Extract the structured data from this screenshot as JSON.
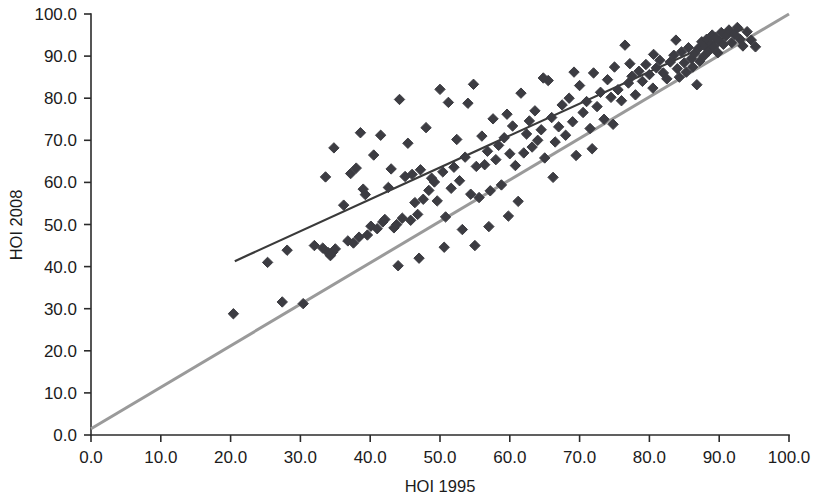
{
  "chart_data": {
    "type": "scatter",
    "title": "",
    "xlabel": "HOI 1995",
    "ylabel": "HOI 2008",
    "xlim": [
      0,
      100
    ],
    "ylim": [
      0,
      100
    ],
    "grid": false,
    "legend": null,
    "xticks": [
      "0.0",
      "10.0",
      "20.0",
      "30.0",
      "40.0",
      "50.0",
      "60.0",
      "70.0",
      "80.0",
      "90.0",
      "100.0"
    ],
    "yticks": [
      "0.0",
      "10.0",
      "20.0",
      "30.0",
      "40.0",
      "50.0",
      "60.0",
      "70.0",
      "80.0",
      "90.0",
      "100.0"
    ],
    "xtick_values": [
      0,
      10,
      20,
      30,
      40,
      50,
      60,
      70,
      80,
      90,
      100
    ],
    "ytick_values": [
      0,
      10,
      20,
      30,
      40,
      50,
      60,
      70,
      80,
      90,
      100
    ],
    "marker": "diamond",
    "marker_color": "#3c3c42",
    "marker_size": 7.2,
    "series": [
      {
        "name": "countries",
        "points": [
          [
            20.4,
            28.8
          ],
          [
            25.3,
            41.0
          ],
          [
            27.4,
            31.6
          ],
          [
            28.1,
            43.9
          ],
          [
            30.4,
            31.2
          ],
          [
            32.0,
            45.0
          ],
          [
            33.2,
            44.4
          ],
          [
            33.6,
            61.3
          ],
          [
            34.0,
            43.3
          ],
          [
            34.3,
            42.6
          ],
          [
            34.6,
            43.4
          ],
          [
            35.0,
            44.2
          ],
          [
            34.8,
            68.2
          ],
          [
            36.2,
            54.6
          ],
          [
            36.8,
            46.1
          ],
          [
            37.2,
            62.1
          ],
          [
            37.6,
            45.6
          ],
          [
            38.0,
            63.4
          ],
          [
            38.4,
            47.0
          ],
          [
            38.6,
            71.8
          ],
          [
            39.0,
            58.4
          ],
          [
            39.3,
            57.1
          ],
          [
            39.6,
            47.5
          ],
          [
            40.1,
            49.6
          ],
          [
            40.5,
            66.5
          ],
          [
            41.0,
            49.0
          ],
          [
            41.5,
            71.2
          ],
          [
            41.8,
            50.6
          ],
          [
            42.1,
            51.2
          ],
          [
            42.6,
            58.8
          ],
          [
            43.0,
            63.2
          ],
          [
            43.4,
            49.2
          ],
          [
            43.8,
            50.0
          ],
          [
            44.2,
            79.7
          ],
          [
            44.6,
            51.5
          ],
          [
            45.0,
            61.4
          ],
          [
            45.4,
            69.3
          ],
          [
            45.8,
            51.0
          ],
          [
            46.0,
            61.9
          ],
          [
            46.4,
            55.2
          ],
          [
            46.8,
            52.4
          ],
          [
            47.2,
            63.0
          ],
          [
            47.6,
            56.0
          ],
          [
            48.0,
            73.0
          ],
          [
            48.4,
            58.1
          ],
          [
            48.8,
            61.0
          ],
          [
            49.2,
            60.1
          ],
          [
            49.6,
            55.6
          ],
          [
            50.0,
            82.1
          ],
          [
            50.4,
            62.5
          ],
          [
            50.8,
            51.8
          ],
          [
            51.2,
            79.0
          ],
          [
            51.6,
            58.6
          ],
          [
            52.0,
            63.6
          ],
          [
            52.4,
            70.2
          ],
          [
            52.8,
            60.4
          ],
          [
            53.2,
            48.8
          ],
          [
            53.6,
            66.0
          ],
          [
            54.0,
            78.8
          ],
          [
            54.4,
            57.2
          ],
          [
            54.8,
            83.3
          ],
          [
            55.2,
            63.8
          ],
          [
            55.6,
            56.4
          ],
          [
            56.0,
            71.0
          ],
          [
            56.4,
            64.2
          ],
          [
            56.8,
            67.4
          ],
          [
            57.2,
            58.0
          ],
          [
            57.6,
            75.1
          ],
          [
            58.0,
            65.4
          ],
          [
            58.4,
            68.8
          ],
          [
            58.8,
            59.4
          ],
          [
            59.2,
            70.6
          ],
          [
            59.6,
            76.2
          ],
          [
            60.0,
            66.8
          ],
          [
            60.4,
            73.4
          ],
          [
            60.8,
            64.0
          ],
          [
            61.2,
            55.5
          ],
          [
            61.6,
            81.2
          ],
          [
            62.0,
            67.0
          ],
          [
            62.4,
            71.5
          ],
          [
            62.8,
            74.6
          ],
          [
            63.2,
            68.4
          ],
          [
            63.6,
            77.0
          ],
          [
            64.0,
            70.0
          ],
          [
            64.5,
            72.5
          ],
          [
            65.0,
            65.8
          ],
          [
            65.5,
            84.2
          ],
          [
            66.0,
            75.4
          ],
          [
            66.5,
            69.6
          ],
          [
            67.0,
            73.2
          ],
          [
            67.5,
            78.4
          ],
          [
            68.0,
            71.2
          ],
          [
            68.5,
            80.0
          ],
          [
            69.0,
            74.4
          ],
          [
            69.5,
            66.4
          ],
          [
            70.0,
            83.0
          ],
          [
            70.5,
            76.6
          ],
          [
            71.0,
            79.2
          ],
          [
            71.5,
            72.8
          ],
          [
            72.0,
            86.0
          ],
          [
            72.5,
            78.0
          ],
          [
            73.0,
            81.4
          ],
          [
            73.5,
            75.0
          ],
          [
            74.0,
            84.4
          ],
          [
            74.5,
            80.2
          ],
          [
            75.0,
            87.4
          ],
          [
            75.5,
            82.0
          ],
          [
            76.0,
            79.4
          ],
          [
            76.5,
            92.6
          ],
          [
            77.0,
            83.6
          ],
          [
            77.5,
            85.2
          ],
          [
            78.0,
            80.8
          ],
          [
            78.5,
            86.4
          ],
          [
            79.0,
            84.0
          ],
          [
            79.5,
            88.0
          ],
          [
            80.0,
            85.6
          ],
          [
            80.5,
            82.4
          ],
          [
            81.0,
            87.2
          ],
          [
            81.5,
            89.0
          ],
          [
            82.0,
            86.0
          ],
          [
            82.5,
            84.6
          ],
          [
            83.0,
            88.6
          ],
          [
            83.5,
            90.2
          ],
          [
            84.0,
            87.0
          ],
          [
            84.3,
            85.0
          ],
          [
            84.6,
            91.0
          ],
          [
            85.0,
            88.4
          ],
          [
            85.3,
            86.2
          ],
          [
            85.6,
            92.0
          ],
          [
            86.0,
            89.4
          ],
          [
            86.2,
            87.4
          ],
          [
            86.5,
            90.6
          ],
          [
            86.8,
            83.2
          ],
          [
            87.0,
            91.8
          ],
          [
            87.2,
            88.8
          ],
          [
            87.5,
            93.4
          ],
          [
            87.8,
            90.0
          ],
          [
            88.0,
            92.4
          ],
          [
            88.2,
            94.0
          ],
          [
            88.5,
            91.2
          ],
          [
            88.8,
            93.0
          ],
          [
            89.0,
            95.0
          ],
          [
            89.2,
            92.2
          ],
          [
            89.5,
            94.4
          ],
          [
            89.8,
            90.8
          ],
          [
            90.0,
            93.6
          ],
          [
            90.3,
            95.6
          ],
          [
            90.6,
            92.8
          ],
          [
            91.0,
            94.8
          ],
          [
            91.4,
            96.2
          ],
          [
            91.8,
            93.2
          ],
          [
            92.2,
            95.2
          ],
          [
            92.6,
            96.8
          ],
          [
            93.0,
            94.0
          ],
          [
            93.4,
            92.4
          ],
          [
            94.0,
            95.8
          ],
          [
            94.6,
            93.8
          ],
          [
            95.2,
            92.2
          ],
          [
            83.8,
            93.8
          ],
          [
            80.6,
            90.4
          ],
          [
            77.2,
            88.2
          ],
          [
            74.8,
            73.8
          ],
          [
            71.8,
            68.0
          ],
          [
            69.2,
            86.2
          ],
          [
            66.2,
            61.2
          ],
          [
            64.8,
            84.8
          ],
          [
            59.8,
            52.0
          ],
          [
            57.0,
            49.5
          ],
          [
            55.0,
            45.0
          ],
          [
            50.6,
            44.6
          ],
          [
            47.0,
            42.0
          ],
          [
            44.0,
            40.2
          ]
        ]
      }
    ],
    "lines": [
      {
        "name": "identity-line",
        "label": "45 degree line",
        "color": "#9a9a9a",
        "x0": 0.0,
        "y0": 1.5,
        "x1": 100.0,
        "y1": 100.0
      },
      {
        "name": "regression-line",
        "label": "fitted trend line",
        "color": "#3a3a3a",
        "x0": 20.6,
        "y0": 41.3,
        "x1": 93.5,
        "y1": 96.5
      }
    ]
  },
  "axes": {
    "x_title": "HOI 1995",
    "y_title": "HOI 2008"
  }
}
